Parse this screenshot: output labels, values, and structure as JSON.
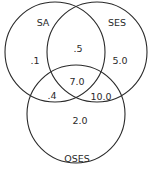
{
  "diagram": {
    "type": "venn",
    "sets": [
      {
        "id": "SA",
        "label": "SA"
      },
      {
        "id": "SES",
        "label": "SES"
      },
      {
        "id": "OSES",
        "label": "OSES"
      }
    ],
    "regions": {
      "SA_only": ".1",
      "SES_only": "5.0",
      "OSES_only": "2.0",
      "SA_SES": ".5",
      "SA_OSES": ".4",
      "SES_OSES": "10.0",
      "SA_SES_OSES": "7.0"
    },
    "colors": {
      "stroke": "#2a2a2a",
      "text": "#2a2a2a",
      "background": "#ffffff"
    }
  }
}
